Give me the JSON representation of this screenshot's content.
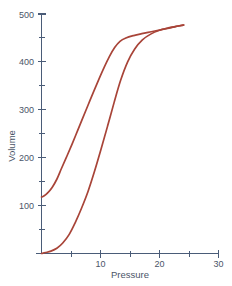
{
  "chart_data": {
    "type": "line",
    "title": "",
    "subtitle": "",
    "xlabel": "Pressure",
    "ylabel": "Volume",
    "xlim": [
      0,
      30
    ],
    "ylim": [
      0,
      500
    ],
    "grid": false,
    "legend": null,
    "legend_position": "none",
    "line_color": "#a84438",
    "axis_color": "#4a5c78",
    "text_color": "#4a5568",
    "background_color": "#ffffff",
    "x_ticks_major": [
      0,
      10,
      20,
      30
    ],
    "x_ticks_major_labels": [
      "",
      "10",
      "20",
      "30"
    ],
    "x_ticks_minor": [
      5,
      15,
      25
    ],
    "y_ticks_major": [
      0,
      100,
      200,
      300,
      400,
      500
    ],
    "y_ticks_major_labels": [
      "",
      "100",
      "200",
      "300",
      "400",
      "500"
    ],
    "y_ticks_minor": [
      50,
      150,
      250,
      350,
      450
    ],
    "series": [
      {
        "name": "Inflation limb",
        "points": [
          [
            0.0,
            0
          ],
          [
            0.7,
            2
          ],
          [
            1.6,
            5
          ],
          [
            2.6,
            11
          ],
          [
            3.6,
            22
          ],
          [
            4.7,
            40
          ],
          [
            5.7,
            64
          ],
          [
            6.8,
            95
          ],
          [
            7.9,
            130
          ],
          [
            9.0,
            172
          ],
          [
            10.1,
            218
          ],
          [
            11.2,
            266
          ],
          [
            12.3,
            315
          ],
          [
            13.4,
            361
          ],
          [
            14.6,
            400
          ],
          [
            15.8,
            427
          ],
          [
            17.1,
            446
          ],
          [
            18.5,
            458
          ],
          [
            20.0,
            466
          ],
          [
            21.5,
            471
          ],
          [
            22.8,
            474
          ],
          [
            23.7,
            476
          ],
          [
            24.1,
            477
          ]
        ]
      },
      {
        "name": "Deflation limb",
        "points": [
          [
            24.1,
            477
          ],
          [
            23.2,
            475
          ],
          [
            21.8,
            471
          ],
          [
            20.2,
            467
          ],
          [
            18.6,
            463
          ],
          [
            17.0,
            459
          ],
          [
            15.6,
            455
          ],
          [
            14.3,
            450
          ],
          [
            13.3,
            443
          ],
          [
            12.4,
            430
          ],
          [
            11.5,
            411
          ],
          [
            10.6,
            388
          ],
          [
            9.7,
            363
          ],
          [
            8.8,
            337
          ],
          [
            7.9,
            310
          ],
          [
            7.0,
            283
          ],
          [
            6.1,
            256
          ],
          [
            5.2,
            229
          ],
          [
            4.3,
            203
          ],
          [
            3.4,
            178
          ],
          [
            2.6,
            155
          ],
          [
            1.8,
            138
          ],
          [
            1.0,
            126
          ],
          [
            0.4,
            120
          ],
          [
            0.0,
            118
          ]
        ]
      }
    ],
    "annotations": []
  },
  "axis": {
    "x_title": "Pressure",
    "y_title": "Volume"
  },
  "x_labels": {
    "t10": "10",
    "t20": "20",
    "t30": "30"
  },
  "y_labels": {
    "t100": "100",
    "t200": "200",
    "t300": "300",
    "t400": "400",
    "t500": "500"
  }
}
